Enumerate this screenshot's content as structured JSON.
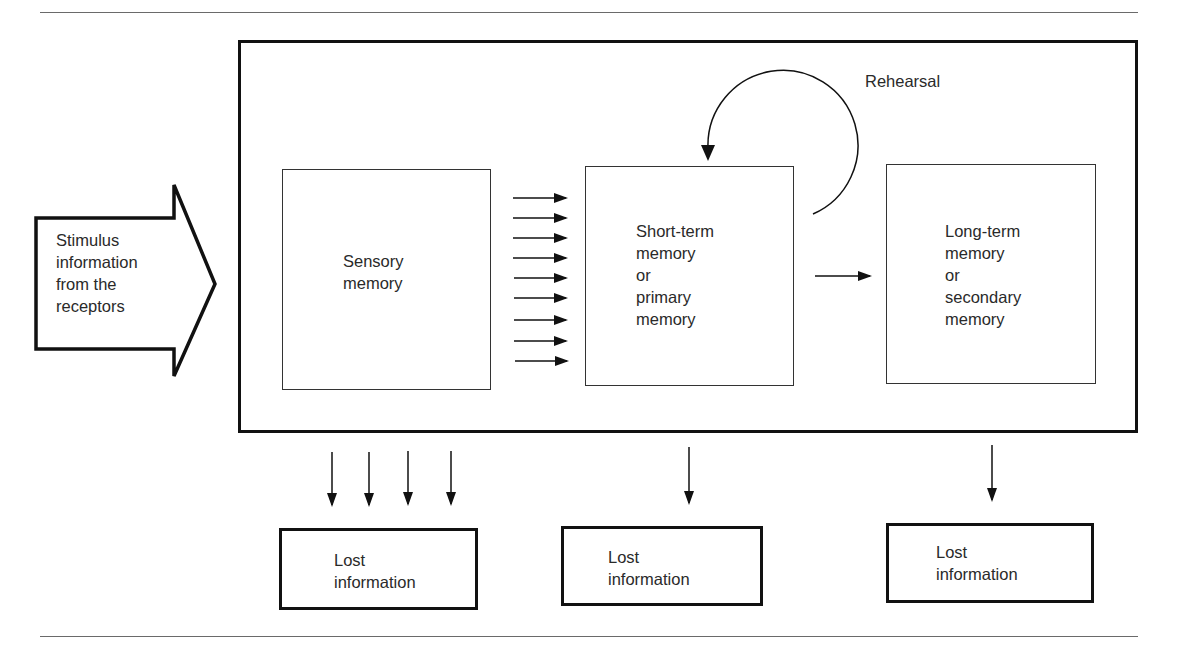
{
  "diagram": {
    "type": "flow",
    "title": "",
    "stimulus": {
      "label": "Stimulus\ninformation\nfrom the\nreceptors"
    },
    "nodes": [
      {
        "id": "sensory",
        "label": "Sensory\nmemory"
      },
      {
        "id": "short_term",
        "label": "Short-term\nmemory\nor\nprimary\nmemory"
      },
      {
        "id": "long_term",
        "label": "Long-term\nmemory\nor\nsecondary\nmemory"
      }
    ],
    "rehearsal": {
      "label": "Rehearsal"
    },
    "lost": [
      {
        "id": "lost_sensory",
        "label": "Lost\ninformation",
        "arrow_count": 4
      },
      {
        "id": "lost_short",
        "label": "Lost\ninformation",
        "arrow_count": 1
      },
      {
        "id": "lost_long",
        "label": "Lost\ninformation",
        "arrow_count": 1
      }
    ],
    "edges": [
      {
        "from": "stimulus",
        "to": "sensory"
      },
      {
        "from": "sensory",
        "to": "short_term",
        "arrow_count": 9
      },
      {
        "from": "short_term",
        "to": "short_term",
        "label": "Rehearsal"
      },
      {
        "from": "short_term",
        "to": "long_term",
        "arrow_count": 1
      },
      {
        "from": "sensory",
        "to": "lost_sensory"
      },
      {
        "from": "short_term",
        "to": "lost_short"
      },
      {
        "from": "long_term",
        "to": "lost_long"
      }
    ],
    "colors": {
      "stroke": "#111111",
      "text": "#2a2a2a",
      "rule": "#6a6a6a",
      "background": "#ffffff"
    }
  }
}
